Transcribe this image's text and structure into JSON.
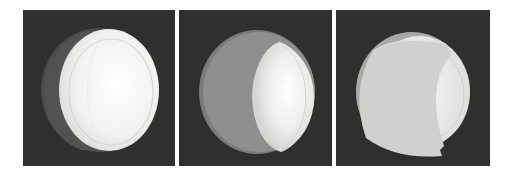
{
  "figure": {
    "panels": [
      {
        "id": "panel-1",
        "description": "disc with thin dark crescent on left, bright white face",
        "background": "#2f2f2f",
        "x": 23,
        "width": 152
      },
      {
        "id": "panel-2",
        "description": "disc with wide grey crescent on left, bright face on right",
        "background": "#2f2f2f",
        "x": 179,
        "width": 153
      },
      {
        "id": "panel-3",
        "description": "disc mostly covered by light grey cap with notches, small bright region on right",
        "background": "#2f2f2f",
        "x": 336,
        "width": 154
      }
    ],
    "colors": {
      "background": "#2f2f2f",
      "face_bright": "#f4f4f2",
      "rim": "#d8d8d6",
      "shadow_crescent_dark": "#4a4a4a",
      "shadow_crescent_grey": "#8e8e8e",
      "cap_light": "#cfcfcd"
    }
  }
}
